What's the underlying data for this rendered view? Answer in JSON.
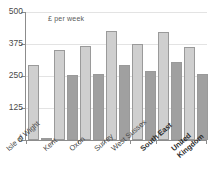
{
  "chart_data": {
    "type": "bar",
    "title": "£ per week",
    "xlabel": "",
    "ylabel": "",
    "ylim": [
      0,
      500
    ],
    "yticks": [
      0,
      125,
      250,
      375,
      500
    ],
    "ytick_labels": [
      "0",
      "125",
      "250",
      "375",
      "500"
    ],
    "grid": true,
    "legend": "none",
    "categories": [
      "Isle of Wight",
      "Kent",
      "Oxon",
      "Surrey",
      "West Sussex",
      "South East",
      "United Kingdom"
    ],
    "category_lines": [
      [
        "Isle of Wight",
        ""
      ],
      [
        "Kent",
        ""
      ],
      [
        "Oxon",
        ""
      ],
      [
        "Surrey",
        ""
      ],
      [
        "West Sussex",
        ""
      ],
      [
        "South East",
        ""
      ],
      [
        "United",
        "Kingdom"
      ]
    ],
    "emphasised_categories": [
      "South East",
      "United Kingdom"
    ],
    "series": [
      {
        "name": "light",
        "color": "#cfcfcf",
        "values": [
          292,
          350,
          368,
          425,
          377,
          422,
          365
        ]
      },
      {
        "name": "dark",
        "color": "#a0a0a0",
        "values": [
          0,
          253,
          259,
          292,
          270,
          303,
          259
        ]
      }
    ]
  }
}
